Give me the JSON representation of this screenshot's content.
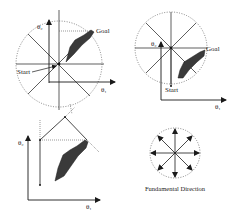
{
  "figure": {
    "panels": [
      {
        "id": "top-left",
        "labels": {
          "goal": "Goal",
          "start": "Start",
          "y_axis": "θ₂",
          "x_axis": "θ₁"
        }
      },
      {
        "id": "top-right",
        "labels": {
          "goal": "Goal",
          "start": "Start",
          "y_axis": "θ₂",
          "x_axis": "θ₁"
        }
      },
      {
        "id": "bottom-left",
        "labels": {
          "y_axis": "θ₂",
          "x_axis": "θ₁"
        }
      },
      {
        "id": "bottom-right",
        "caption": "Fundamental Direction",
        "directions": 8
      }
    ],
    "colors": {
      "line": "#1a1a1a",
      "obstacle": "#3a3a3a",
      "dotted": "#555555",
      "background": "#ffffff"
    }
  }
}
